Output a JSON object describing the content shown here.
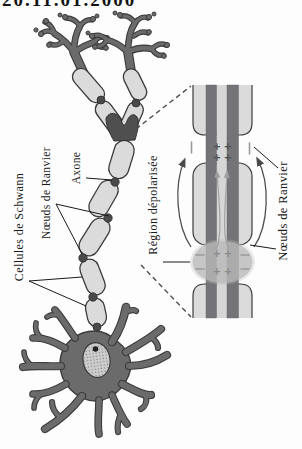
{
  "figure": {
    "cropped_top_text": "20.11.01.2000",
    "labels": {
      "cellules_de_schwann": "Cellules de Schwann",
      "noeuds_de_ranvier_left": "Nœuds de Ranvier",
      "axone": "Axone",
      "region_depolarisee": "Région dépolarisée",
      "noeuds_de_ranvier_right": "Nœuds de Ranvier"
    },
    "symbols": {
      "plus": "+",
      "minus": "−"
    },
    "colors": {
      "cell": "#6b6b6b",
      "outline": "#3c3c3c",
      "myelin": "#dbdbdb",
      "membrane": "#737378",
      "depolarized": "#b9b9b9",
      "node": "#4a4a4a",
      "symdark": "#4f4f4f",
      "symgray": "#9b9b9b"
    }
  }
}
